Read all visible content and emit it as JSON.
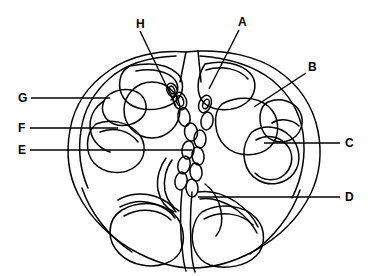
{
  "figure": {
    "background_color": "#ffffff",
    "ink_color": "#000000",
    "width": 374,
    "height": 276
  },
  "labels": [
    {
      "id": "A",
      "text": "A",
      "x": 238,
      "y": 16,
      "leader": {
        "x1": 239,
        "y1": 30,
        "x2": 209,
        "y2": 89
      }
    },
    {
      "id": "B",
      "text": "B",
      "x": 308,
      "y": 61,
      "leader": {
        "x1": 306,
        "y1": 73,
        "x2": 254,
        "y2": 107
      }
    },
    {
      "id": "C",
      "text": "C",
      "x": 345,
      "y": 137,
      "leader": {
        "x1": 340,
        "y1": 143,
        "x2": 264,
        "y2": 143
      }
    },
    {
      "id": "D",
      "text": "D",
      "x": 345,
      "y": 191,
      "leader": {
        "x1": 340,
        "y1": 197,
        "x2": 198,
        "y2": 197
      }
    },
    {
      "id": "E",
      "text": "E",
      "x": 18,
      "y": 144,
      "leader": {
        "x1": 30,
        "y1": 150,
        "x2": 192,
        "y2": 150
      }
    },
    {
      "id": "F",
      "text": "F",
      "x": 18,
      "y": 122,
      "leader": {
        "x1": 30,
        "y1": 128,
        "x2": 118,
        "y2": 128
      }
    },
    {
      "id": "G",
      "text": "G",
      "x": 18,
      "y": 92,
      "leader": {
        "x1": 31,
        "y1": 98,
        "x2": 110,
        "y2": 98
      }
    },
    {
      "id": "H",
      "text": "H",
      "x": 136,
      "y": 18,
      "leader": {
        "x1": 140,
        "y1": 31,
        "x2": 176,
        "y2": 106
      }
    }
  ],
  "structures": {
    "outline_name": "cranial-outline",
    "regions": [
      "frontal-region",
      "orbital-plate-left",
      "orbital-plate-right",
      "petrous-temporal-left",
      "petrous-temporal-right",
      "sphenoid-body",
      "nasal-septum-chain",
      "occipital-lobe-left",
      "occipital-lobe-right"
    ]
  }
}
